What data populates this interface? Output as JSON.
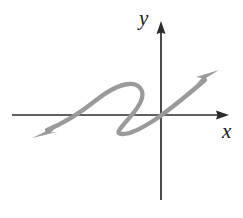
{
  "figure": {
    "background_color": "#ffffff",
    "axis_color": "#2b2b2b",
    "curve_color": "#9a9a9a",
    "axes": {
      "origin": {
        "x": 161,
        "y": 115
      },
      "x_axis": {
        "label": "x",
        "label_position": {
          "x": 222,
          "y": 121
        },
        "start": {
          "x": 12,
          "y": 115
        },
        "end": {
          "x": 228,
          "y": 115
        },
        "arrowhead": "right",
        "stroke_width": 1.6
      },
      "y_axis": {
        "label": "y",
        "label_position": {
          "x": 139,
          "y": 8
        },
        "start": {
          "x": 161,
          "y": 200
        },
        "end": {
          "x": 161,
          "y": 24
        },
        "arrowhead": "up",
        "stroke_width": 1.6
      }
    },
    "curve": {
      "name": "cubic-squiggle-curve",
      "stroke": "#9a9a9a",
      "stroke_width": 4.2,
      "style": "hand-drawn",
      "arrowheads": [
        "lower-left",
        "upper-right"
      ],
      "path": "M 48 131 C 70 122, 92 104, 108 92 C 118 84, 132 82, 139 90 C 145 97, 140 107, 133 116 C 126 125, 117 133, 124 133 C 133 133, 146 127, 158 119 C 176 107, 196 90, 210 78",
      "lower_left_arrow": {
        "tip": {
          "x": 33,
          "y": 137
        },
        "direction": "down-left",
        "points": "33,137 55,128 51,133 56,131"
      },
      "upper_right_arrow": {
        "tip": {
          "x": 218,
          "y": 71
        },
        "direction": "up-right",
        "points": "218,71 200,82 205,77 199,76"
      },
      "features": {
        "local_max_approx": {
          "x": 131,
          "y": 85
        },
        "local_min_approx": {
          "x": 126,
          "y": 133
        },
        "x_intercepts_approx": [
          70,
          134,
          159
        ],
        "passes_near_origin": true
      }
    }
  }
}
